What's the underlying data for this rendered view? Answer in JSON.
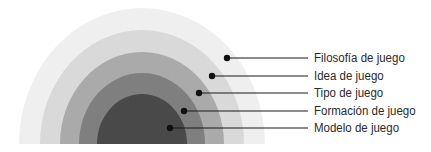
{
  "diagram": {
    "layers": [
      {
        "label": "Filosofía de juego",
        "color": "#eeefee",
        "rx": 123,
        "ry": 136,
        "dot": [
          227,
          58
        ],
        "y": 58
      },
      {
        "label": "Idea de juego",
        "color": "#d8d9d8",
        "rx": 102,
        "ry": 114,
        "dot": [
          212,
          76
        ],
        "y": 76
      },
      {
        "label": "Tipo de juego",
        "color": "#a9aaa9",
        "rx": 82,
        "ry": 92,
        "dot": [
          199,
          93
        ],
        "y": 93
      },
      {
        "label": "Formación de juego",
        "color": "#7f7f7f",
        "rx": 63,
        "ry": 71,
        "dot": [
          184,
          111
        ],
        "y": 111
      },
      {
        "label": "Modelo de juego",
        "color": "#4a494a",
        "rx": 45,
        "ry": 50,
        "dot": [
          170,
          128
        ],
        "y": 128
      }
    ],
    "center": [
      142,
      144
    ],
    "line_end_x": 308,
    "line_color": "#1a1a1a",
    "dot_color": "#111111"
  }
}
